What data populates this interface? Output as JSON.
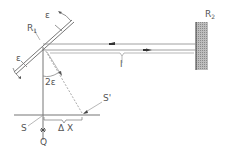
{
  "diagram": {
    "type": "optical-lever-mirror-setup",
    "labels": {
      "mirror1": "R",
      "mirror1_sub": "1",
      "mirror2": "R",
      "mirror2_sub": "2",
      "epsilon_top": "ε",
      "epsilon_left": "ε",
      "distance": "l",
      "angle": "2ε",
      "screen": "S",
      "screen_prime": "S'",
      "displacement": "Δ X",
      "source": "Q"
    },
    "colors": {
      "line": "#666666",
      "hatch": "#9a9a9a",
      "text": "#555555"
    }
  }
}
